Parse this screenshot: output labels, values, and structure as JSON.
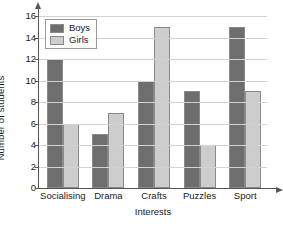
{
  "chart_data": {
    "type": "bar",
    "title": "",
    "xlabel": "Interests",
    "ylabel": "Number of students",
    "categories": [
      "Socialising",
      "Drama",
      "Crafts",
      "Puzzles",
      "Sport"
    ],
    "series": [
      {
        "name": "Boys",
        "values": [
          12,
          5,
          10,
          9,
          15
        ],
        "color": "#6e6e6e"
      },
      {
        "name": "Girls",
        "values": [
          6,
          7,
          15,
          4,
          9
        ],
        "color": "#cdcdcd"
      }
    ],
    "ylim": [
      0,
      16
    ],
    "ytick_labels": [
      "0",
      "2",
      "4",
      "6",
      "8",
      "10",
      "12",
      "14",
      "16"
    ],
    "ytick_values": [
      0,
      2,
      4,
      6,
      8,
      10,
      12,
      14,
      16
    ],
    "grid": true,
    "legend_position": "top-left",
    "grid_color": "#d2d2d2",
    "axis_color": "#555555",
    "bar_border_color": "#8a8a8a",
    "background": "#ffffff"
  }
}
